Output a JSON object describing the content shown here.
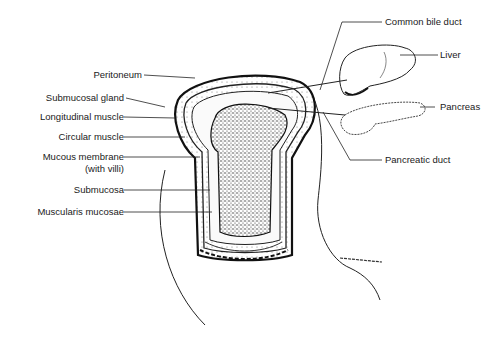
{
  "diagram": {
    "left_labels": [
      {
        "id": "peritoneum",
        "text": "Peritoneum"
      },
      {
        "id": "submucosal-gland",
        "text": "Submucosal gland"
      },
      {
        "id": "longitudinal-muscle",
        "text": "Longitudinal muscle"
      },
      {
        "id": "circular-muscle",
        "text": "Circular muscle"
      },
      {
        "id": "mucous-membrane",
        "text": "Mucous membrane"
      },
      {
        "id": "mucous-membrane-sub",
        "text": "(with villi)"
      },
      {
        "id": "submucosa",
        "text": "Submucosa"
      },
      {
        "id": "muscularis-mucosae",
        "text": "Muscularis mucosae"
      }
    ],
    "right_labels": [
      {
        "id": "common-bile-duct",
        "text": "Common bile duct"
      },
      {
        "id": "liver",
        "text": "Liver"
      },
      {
        "id": "pancreas",
        "text": "Pancreas"
      },
      {
        "id": "pancreatic-duct",
        "text": "Pancreatic duct"
      }
    ],
    "signature": "Alison Fitzgerald"
  }
}
